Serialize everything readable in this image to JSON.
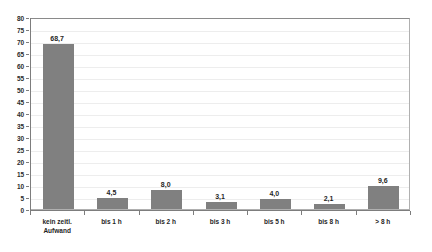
{
  "chart_data": {
    "type": "bar",
    "title": "",
    "subtitle": "",
    "xlabel": "",
    "ylabel": "",
    "categories": [
      "kein zeitl.\nAufwand",
      "bis 1 h",
      "bis 2 h",
      "bis 3 h",
      "bis 5 h",
      "bis 8 h",
      "> 8 h"
    ],
    "values": [
      68.7,
      4.5,
      8.0,
      3.1,
      4.0,
      2.1,
      9.6
    ],
    "value_labels": [
      "68,7",
      "4,5",
      "8,0",
      "3,1",
      "4,0",
      "2,1",
      "9,6"
    ],
    "ylim": [
      0,
      80
    ],
    "ytick_step": 5,
    "ytick_labels": [
      "80",
      "75",
      "70",
      "65",
      "60",
      "55",
      "50",
      "45",
      "40",
      "35",
      "30",
      "25",
      "20",
      "15",
      "10",
      "5",
      "0"
    ],
    "ytick_values": [
      80,
      75,
      70,
      65,
      60,
      55,
      50,
      45,
      40,
      35,
      30,
      25,
      20,
      15,
      10,
      5,
      0
    ],
    "grid": true,
    "grid_axis": "y",
    "legend": false,
    "legend_position": "none",
    "series": [
      {
        "name": "",
        "values": [
          68.7,
          4.5,
          8.0,
          3.1,
          4.0,
          2.1,
          9.6
        ]
      }
    ]
  },
  "colors": {
    "bar": "#808080",
    "grid": "#ededed",
    "axis": "#7d7d7d",
    "plot_border": "#b0b0b0",
    "text": "#1f1f1f",
    "background": "#ffffff"
  }
}
